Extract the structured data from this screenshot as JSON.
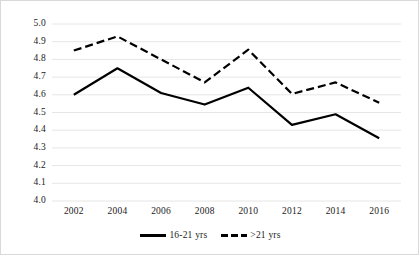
{
  "chart_data": {
    "type": "line",
    "title": "",
    "subtitle": "",
    "xlabel": "",
    "ylabel": "",
    "categories": [
      "2002",
      "2004",
      "2006",
      "2008",
      "2010",
      "2012",
      "2014",
      "2016"
    ],
    "x": [
      2002,
      2004,
      2006,
      2008,
      2010,
      2012,
      2014,
      2016
    ],
    "series": [
      {
        "name": "16-21 yrs",
        "style": "solid",
        "color": "#000000",
        "values": [
          4.6,
          4.75,
          4.61,
          4.545,
          4.64,
          4.43,
          4.49,
          4.355
        ]
      },
      {
        "name": ">21 yrs",
        "style": "dashed",
        "color": "#000000",
        "values": [
          4.85,
          4.93,
          4.8,
          4.67,
          4.855,
          4.605,
          4.67,
          4.555
        ]
      }
    ],
    "ylim": [
      4.0,
      5.0
    ],
    "ytick_labels": [
      "5.0",
      "4.9",
      "4.8",
      "4.7",
      "4.6",
      "4.5",
      "4.4",
      "4.3",
      "4.2",
      "4.1",
      "4.0"
    ],
    "ytick_values": [
      5.0,
      4.9,
      4.8,
      4.7,
      4.6,
      4.5,
      4.4,
      4.3,
      4.2,
      4.1,
      4.0
    ],
    "grid": "horizontal",
    "gridline_color": "#e6e6e6",
    "legend_position": "bottom",
    "frame_color": "#d9d9d9",
    "background": "#ffffff"
  },
  "legend": {
    "entries": [
      {
        "label": "16-21 yrs"
      },
      {
        "label": ">21 yrs"
      }
    ]
  }
}
